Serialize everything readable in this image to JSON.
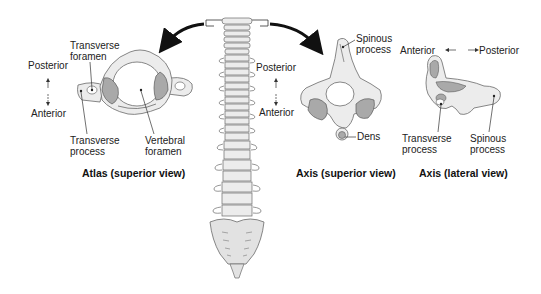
{
  "diagram": {
    "panels": [
      {
        "id": "atlas-superior",
        "title": "Atlas (superior view)",
        "orientation": {
          "top": "Posterior",
          "bottom": "Anterior"
        },
        "labels": [
          "Transverse foramen",
          "Transverse process",
          "Vertebral foramen"
        ]
      },
      {
        "id": "axis-superior",
        "title": "Axis (superior view)",
        "orientation": {
          "top": "Posterior",
          "bottom": "Anterior"
        },
        "labels": [
          "Spinous process",
          "Dens"
        ]
      },
      {
        "id": "axis-lateral",
        "title": "Axis (lateral view)",
        "orientation": {
          "left": "Anterior",
          "right": "Posterior"
        },
        "labels": [
          "Transverse process",
          "Spinous process"
        ]
      }
    ],
    "center": "Vertebral column with bracket on top two cervical vertebrae"
  },
  "atlas": {
    "title": "Atlas (superior view)",
    "posterior": "Posterior",
    "anterior": "Anterior",
    "transverse_foramen_l1": "Transverse",
    "transverse_foramen_l2": "foramen",
    "transverse_process_l1": "Transverse",
    "transverse_process_l2": "process",
    "vertebral_foramen_l1": "Vertebral",
    "vertebral_foramen_l2": "foramen"
  },
  "axis_superior": {
    "title": "Axis (superior view)",
    "posterior": "Posterior",
    "anterior": "Anterior",
    "spinous_l1": "Spinous",
    "spinous_l2": "process",
    "dens": "Dens"
  },
  "axis_lateral": {
    "title": "Axis (lateral view)",
    "anterior": "Anterior",
    "posterior": "Posterior",
    "transverse_l1": "Transverse",
    "transverse_l2": "process",
    "spinous_l1": "Spinous",
    "spinous_l2": "process"
  },
  "colors": {
    "bone": "#ececec",
    "bone_stroke": "#6a6a6a",
    "facet": "#a9a9a9",
    "arrow": "#111111",
    "text": "#222222"
  }
}
